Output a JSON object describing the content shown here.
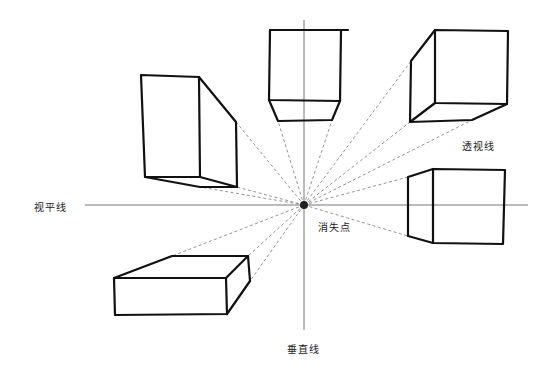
{
  "labels": {
    "horizon_line": "视平线",
    "vanishing_point": "消失点",
    "perspective_line": "透视线",
    "vertical_line": "垂直线"
  },
  "colors": {
    "background": "#ffffff",
    "box_stroke": "#111111",
    "guide_stroke": "#777777",
    "dashed_stroke": "#888888",
    "vanishing_point_fill": "#222222"
  },
  "geometry": {
    "vanishing_point": [
      304,
      205
    ],
    "horizon_line": {
      "x1": 85,
      "x2": 528,
      "y": 205
    },
    "vertical_line": {
      "x": 304,
      "y1": 20,
      "y2": 330
    }
  }
}
